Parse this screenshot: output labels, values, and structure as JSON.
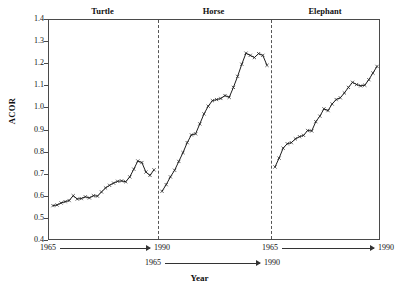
{
  "chart_data": {
    "type": "line",
    "title": "",
    "xlabel": "Year",
    "ylabel": "ACOR",
    "ylim": [
      0.4,
      1.4
    ],
    "ytick_labels": [
      "1.4",
      "1.3",
      "1.2",
      "1.1",
      "1.0",
      "0.9",
      "0.8",
      "0.7",
      "0.6",
      "0.5",
      "0.4"
    ],
    "ytick_values": [
      1.4,
      1.3,
      1.2,
      1.1,
      1.0,
      0.9,
      0.8,
      0.7,
      0.6,
      0.5,
      0.4
    ],
    "grid": false,
    "legend": "none",
    "panels": [
      {
        "name": "Turtle",
        "x_start_label": "1965",
        "x_end_label": "1990",
        "x": [
          1965,
          1966,
          1967,
          1968,
          1969,
          1970,
          1971,
          1972,
          1973,
          1974,
          1975,
          1976,
          1977,
          1978,
          1979,
          1980,
          1981,
          1982,
          1983,
          1984,
          1985,
          1986,
          1987,
          1988,
          1989,
          1990
        ],
        "values": [
          0.56,
          0.563,
          0.572,
          0.578,
          0.583,
          0.605,
          0.59,
          0.592,
          0.6,
          0.595,
          0.605,
          0.603,
          0.622,
          0.64,
          0.652,
          0.662,
          0.67,
          0.672,
          0.668,
          0.69,
          0.725,
          0.762,
          0.755,
          0.712,
          0.697,
          0.722
        ]
      },
      {
        "name": "Horse",
        "x_start_label": "1965",
        "x_end_label": "1990",
        "x": [
          1965,
          1966,
          1967,
          1968,
          1969,
          1970,
          1971,
          1972,
          1973,
          1974,
          1975,
          1976,
          1977,
          1978,
          1979,
          1980,
          1981,
          1982,
          1983,
          1984,
          1985,
          1986,
          1987,
          1988,
          1989,
          1990
        ],
        "values": [
          0.625,
          0.655,
          0.69,
          0.72,
          0.76,
          0.8,
          0.845,
          0.88,
          0.885,
          0.93,
          0.975,
          1.01,
          1.035,
          1.04,
          1.045,
          1.058,
          1.05,
          1.095,
          1.145,
          1.2,
          1.25,
          1.24,
          1.23,
          1.248,
          1.24,
          1.195
        ]
      },
      {
        "name": "Elephant",
        "x_start_label": "1965",
        "x_end_label": "1990",
        "x": [
          1965,
          1966,
          1967,
          1968,
          1969,
          1970,
          1971,
          1972,
          1973,
          1974,
          1975,
          1976,
          1977,
          1978,
          1979,
          1980,
          1981,
          1982,
          1983,
          1984,
          1985,
          1986,
          1987,
          1988,
          1989,
          1990
        ],
        "values": [
          0.735,
          0.775,
          0.82,
          0.84,
          0.845,
          0.862,
          0.872,
          0.878,
          0.9,
          0.898,
          0.94,
          0.965,
          0.998,
          0.99,
          1.02,
          1.04,
          1.048,
          1.07,
          1.095,
          1.118,
          1.108,
          1.102,
          1.105,
          1.13,
          1.16,
          1.19
        ]
      }
    ],
    "x_rulers": [
      {
        "start": "1965",
        "end": "1990"
      },
      {
        "start": "1965",
        "end": "1990"
      },
      {
        "start": "1965",
        "end": "1990"
      }
    ]
  }
}
